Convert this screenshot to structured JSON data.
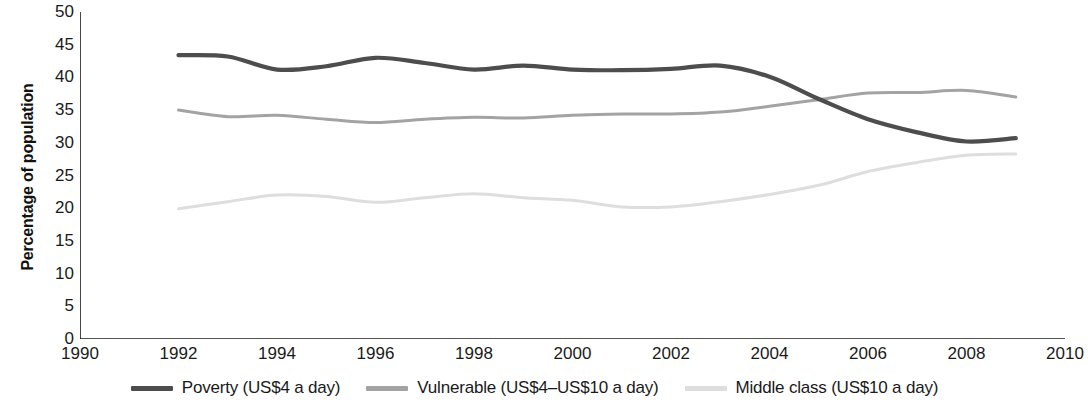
{
  "chart_data": {
    "type": "line",
    "title": "",
    "xlabel": "",
    "ylabel": "Percentage of population",
    "xlim": [
      1990,
      2010
    ],
    "ylim": [
      0,
      50
    ],
    "ytick_step": 5,
    "xtick_step": 2,
    "grid": false,
    "legend_position": "bottom",
    "xticks": [
      1990,
      1992,
      1994,
      1996,
      1998,
      2000,
      2002,
      2004,
      2006,
      2008,
      2010
    ],
    "yticks": [
      0,
      5,
      10,
      15,
      20,
      25,
      30,
      35,
      40,
      45,
      50
    ],
    "x": [
      1992,
      1993,
      1994,
      1995,
      1996,
      1997,
      1998,
      1999,
      2000,
      2001,
      2002,
      2003,
      2004,
      2005,
      2006,
      2007,
      2008,
      2009
    ],
    "series": [
      {
        "name": "Poverty (US$4 a day)",
        "color": "#4d4d4d",
        "width": 4.2,
        "values": [
          43.4,
          43.2,
          41.2,
          41.7,
          43.0,
          42.2,
          41.2,
          41.8,
          41.2,
          41.1,
          41.3,
          41.8,
          40.1,
          36.7,
          33.6,
          31.6,
          30.2,
          30.7
        ]
      },
      {
        "name": "Vulnerable (US$4–US$10 a day)",
        "color": "#a3a3a3",
        "width": 3.0,
        "values": [
          35.0,
          34.0,
          34.2,
          33.6,
          33.1,
          33.6,
          33.9,
          33.8,
          34.2,
          34.4,
          34.4,
          34.7,
          35.6,
          36.6,
          37.6,
          37.7,
          38.0,
          37.0
        ]
      },
      {
        "name": "Middle class (US$10 a day)",
        "color": "#dedede",
        "width": 3.0,
        "values": [
          19.9,
          21.0,
          22.0,
          21.8,
          20.9,
          21.6,
          22.2,
          21.6,
          21.2,
          20.2,
          20.2,
          21.0,
          22.1,
          23.5,
          25.6,
          27.0,
          28.1,
          28.3
        ]
      }
    ]
  },
  "axes": {
    "y_title": "Percentage of population",
    "axis_color": "#1a1a1a"
  },
  "legend": {
    "items": [
      {
        "label": "Poverty (US$4 a day)",
        "color": "#4d4d4d"
      },
      {
        "label": "Vulnerable (US$4–US$10 a day)",
        "color": "#a3a3a3"
      },
      {
        "label": "Middle class (US$10 a day)",
        "color": "#dedede"
      }
    ]
  }
}
